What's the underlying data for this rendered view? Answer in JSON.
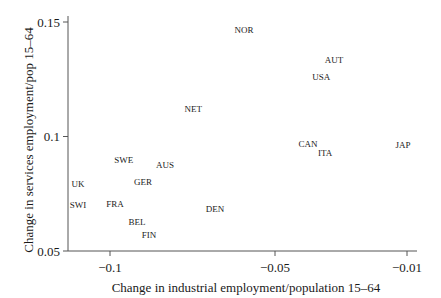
{
  "chart_data": {
    "type": "scatter",
    "title": "",
    "xlabel": "Change in industrial employment/population 15–64",
    "ylabel": "Change in services employment/pop 15–64",
    "xlim": [
      -0.113,
      -0.007
    ],
    "ylim": [
      0.05,
      0.152
    ],
    "xticks": [
      {
        "value": -0.1,
        "label": "−0.1"
      },
      {
        "value": -0.05,
        "label": "−0.05"
      },
      {
        "value": -0.01,
        "label": "−0.01"
      }
    ],
    "yticks": [
      {
        "value": 0.05,
        "label": "0.05"
      },
      {
        "value": 0.1,
        "label": "0.1"
      },
      {
        "value": 0.15,
        "label": "0.15"
      }
    ],
    "grid": false,
    "legend": null,
    "marker": "text-label",
    "points": [
      {
        "label": "NOR",
        "x": -0.0594,
        "y": 0.1465
      },
      {
        "label": "AUT",
        "x": -0.0321,
        "y": 0.1334
      },
      {
        "label": "USA",
        "x": -0.036,
        "y": 0.126
      },
      {
        "label": "NET",
        "x": -0.0748,
        "y": 0.112
      },
      {
        "label": "CAN",
        "x": -0.04,
        "y": 0.0966
      },
      {
        "label": "ITA",
        "x": -0.0348,
        "y": 0.093
      },
      {
        "label": "JAP",
        "x": -0.0112,
        "y": 0.0962
      },
      {
        "label": "SWE",
        "x": -0.0958,
        "y": 0.09
      },
      {
        "label": "AUS",
        "x": -0.0833,
        "y": 0.0878
      },
      {
        "label": "UK",
        "x": -0.1097,
        "y": 0.0793
      },
      {
        "label": "GER",
        "x": -0.09,
        "y": 0.0801
      },
      {
        "label": "SWI",
        "x": -0.1097,
        "y": 0.0701
      },
      {
        "label": "FRA",
        "x": -0.0985,
        "y": 0.0707
      },
      {
        "label": "DEN",
        "x": -0.0682,
        "y": 0.0683
      },
      {
        "label": "BEL",
        "x": -0.0918,
        "y": 0.0629
      },
      {
        "label": "FIN",
        "x": -0.0882,
        "y": 0.0572
      }
    ]
  },
  "colors": {
    "axis": "#555555",
    "text": "#1a1a1a",
    "background": "#ffffff"
  }
}
